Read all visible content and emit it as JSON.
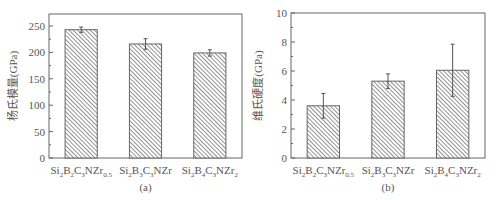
{
  "chart_data": [
    {
      "type": "bar",
      "panel": "(a)",
      "title": "",
      "xlabel": "",
      "ylabel": "杨氏模量(GPa)",
      "ylim": [
        0,
        270
      ],
      "yticks": [
        0,
        50,
        100,
        150,
        200,
        250
      ],
      "categories": [
        "Si2B2C3NZr0.5",
        "Si2B3C3NZr",
        "Si2B4C3NZr2"
      ],
      "category_parts": [
        [
          [
            "Si",
            ""
          ],
          [
            "2",
            "sub"
          ],
          [
            "B",
            ""
          ],
          [
            "2",
            "sub"
          ],
          [
            "C",
            ""
          ],
          [
            "3",
            "sub"
          ],
          [
            "NZr",
            ""
          ],
          [
            "0.5",
            "sub"
          ]
        ],
        [
          [
            "Si",
            ""
          ],
          [
            "2",
            "sub"
          ],
          [
            "B",
            ""
          ],
          [
            "3",
            "sub"
          ],
          [
            "C",
            ""
          ],
          [
            "3",
            "sub"
          ],
          [
            "NZr",
            ""
          ]
        ],
        [
          [
            "Si",
            ""
          ],
          [
            "2",
            "sub"
          ],
          [
            "B",
            ""
          ],
          [
            "4",
            "sub"
          ],
          [
            "C",
            ""
          ],
          [
            "3",
            "sub"
          ],
          [
            "NZr",
            ""
          ],
          [
            "2",
            "sub"
          ]
        ]
      ],
      "values": [
        243,
        216,
        199
      ],
      "errors": [
        5,
        10,
        6
      ],
      "grid": false,
      "legend": null,
      "fill": "hatched diagonal",
      "color": "#777777"
    },
    {
      "type": "bar",
      "panel": "(b)",
      "title": "",
      "xlabel": "",
      "ylabel": "维氏硬度(GPa)",
      "ylim": [
        0,
        10
      ],
      "yticks": [
        0,
        2,
        4,
        6,
        8,
        10
      ],
      "categories": [
        "Si2B2C3NZr0.5",
        "Si2B3C3NZr",
        "Si2B4C3NZr2"
      ],
      "category_parts": [
        [
          [
            "Si",
            ""
          ],
          [
            "2",
            "sub"
          ],
          [
            "B",
            ""
          ],
          [
            "2",
            "sub"
          ],
          [
            "C",
            ""
          ],
          [
            "3",
            "sub"
          ],
          [
            "NZr",
            ""
          ],
          [
            "0.5",
            "sub"
          ]
        ],
        [
          [
            "Si",
            ""
          ],
          [
            "2",
            "sub"
          ],
          [
            "B",
            ""
          ],
          [
            "3",
            "sub"
          ],
          [
            "C",
            ""
          ],
          [
            "3",
            "sub"
          ],
          [
            "NZr",
            ""
          ]
        ],
        [
          [
            "Si",
            ""
          ],
          [
            "2",
            "sub"
          ],
          [
            "B",
            ""
          ],
          [
            "4",
            "sub"
          ],
          [
            "C",
            ""
          ],
          [
            "3",
            "sub"
          ],
          [
            "NZr",
            ""
          ],
          [
            "2",
            "sub"
          ]
        ]
      ],
      "values": [
        3.6,
        5.3,
        6.05
      ],
      "errors": [
        0.85,
        0.5,
        1.8
      ],
      "grid": false,
      "legend": null,
      "fill": "hatched diagonal",
      "color": "#777777"
    }
  ]
}
